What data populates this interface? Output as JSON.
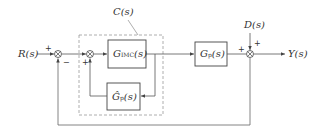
{
  "diagram": {
    "type": "block-diagram",
    "signals": {
      "input": "R(s)",
      "output": "Y(s)",
      "disturbance": "D(s)"
    },
    "controller_label": "C(s)",
    "blocks": {
      "imc": {
        "main": "G",
        "sub": "IMC",
        "arg": "(s)"
      },
      "model": {
        "main": "Ĝ",
        "sub": "p",
        "arg": "(s)"
      },
      "plant": {
        "main": "G",
        "sub": "p",
        "arg": "(s)"
      }
    },
    "summing_junctions": {
      "sum1": {
        "signs": [
          "+",
          "−"
        ]
      },
      "sum2": {
        "signs": [
          "+"
        ]
      },
      "sum3": {
        "signs": [
          "+",
          "+"
        ]
      }
    },
    "colors": {
      "line": "#555555",
      "dashed": "#999999",
      "text": "#333333"
    }
  }
}
